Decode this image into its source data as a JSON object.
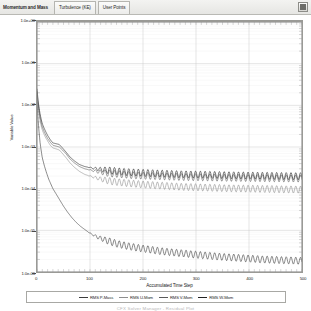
{
  "window": {
    "close_button": "close-box"
  },
  "tabs": [
    {
      "label": "Momentum and Mass",
      "active": true
    },
    {
      "label": "Turbulence (KE)",
      "active": false
    },
    {
      "label": "User Points",
      "active": false
    }
  ],
  "caption": "CFX Solver Manager - Residual Plot",
  "chart_data": {
    "type": "line",
    "title": "",
    "xlabel": "Accumulated Time Step",
    "ylabel": "Variable Value",
    "yscale": "log",
    "xlim": [
      0,
      500
    ],
    "ylim": [
      1e-06,
      1
    ],
    "grid": true,
    "legend_position": "bottom",
    "xticks": [
      0,
      100,
      200,
      300,
      400,
      500
    ],
    "xtick_labels": [
      "0",
      "100",
      "200",
      "300",
      "400",
      "500"
    ],
    "yticks": [
      1,
      0.1,
      0.01,
      0.001,
      0.0001,
      1e-05,
      1e-06
    ],
    "ytick_labels": [
      "1.0e+00",
      "1.0e-01",
      "1.0e-02",
      "1.0e-03",
      "1.0e-04",
      "1.0e-05",
      "1.0e-06"
    ],
    "series": [
      {
        "name": "RMS P-Mass",
        "color": "#3c3c3c",
        "x": [
          0,
          2,
          4,
          6,
          8,
          10,
          14,
          18,
          22,
          26,
          30,
          36,
          42,
          50,
          58,
          66,
          74,
          82,
          90,
          100,
          115,
          130,
          150,
          170,
          190,
          210,
          230,
          250,
          275,
          300,
          325,
          350,
          375,
          400,
          425,
          450,
          475,
          500
        ],
        "y": [
          0.012,
          0.0045,
          0.0022,
          0.0012,
          0.0008,
          0.00055,
          0.00035,
          0.00024,
          0.00017,
          0.00013,
          0.0001,
          7.5e-05,
          5.6e-05,
          3.8e-05,
          2.7e-05,
          2e-05,
          1.55e-05,
          1.25e-05,
          1.05e-05,
          8.5e-06,
          6.8e-06,
          5.8e-06,
          4.8e-06,
          4.2e-06,
          3.8e-06,
          3.5e-06,
          3.2e-06,
          3e-06,
          2.8e-06,
          2.6e-06,
          2.45e-06,
          2.3e-06,
          2.2e-06,
          2.1e-06,
          2e-06,
          1.95e-06,
          1.9e-06,
          1.85e-06
        ]
      },
      {
        "name": "RMS U-Mom",
        "color": "#8e8e8e",
        "x": [
          0,
          2,
          4,
          6,
          9,
          12,
          16,
          20,
          25,
          30,
          36,
          42,
          48,
          55,
          62,
          70,
          80,
          90,
          100,
          120,
          140,
          160,
          180,
          200,
          225,
          250,
          275,
          300,
          330,
          360,
          400,
          440,
          470,
          500
        ],
        "y": [
          0.02,
          0.009,
          0.006,
          0.0042,
          0.0028,
          0.0022,
          0.0017,
          0.0014,
          0.0011,
          0.00095,
          0.0009,
          0.00085,
          0.0007,
          0.00055,
          0.00042,
          0.00033,
          0.00026,
          0.00022,
          0.0002,
          0.00017,
          0.00015,
          0.00014,
          0.000132,
          0.000126,
          0.00012,
          0.000115,
          0.00011,
          0.000108,
          0.000105,
          0.000102,
          0.0001,
          9.8e-05,
          9.6e-05,
          9.5e-05
        ]
      },
      {
        "name": "RMS V-Mom",
        "color": "#5a5a5a",
        "x": [
          0,
          2,
          4,
          6,
          9,
          12,
          16,
          20,
          25,
          30,
          36,
          42,
          48,
          55,
          62,
          70,
          80,
          90,
          100,
          120,
          140,
          160,
          180,
          200,
          225,
          250,
          275,
          300,
          330,
          360,
          400,
          440,
          470,
          500
        ],
        "y": [
          0.022,
          0.011,
          0.007,
          0.005,
          0.0033,
          0.0026,
          0.002,
          0.0016,
          0.0013,
          0.0011,
          0.00105,
          0.001,
          0.00085,
          0.00068,
          0.00052,
          0.00042,
          0.00034,
          0.0003,
          0.00028,
          0.00025,
          0.00023,
          0.00022,
          0.00021,
          0.000205,
          0.0002,
          0.000195,
          0.00019,
          0.000188,
          0.000185,
          0.000182,
          0.00018,
          0.000178,
          0.000176,
          0.000175
        ]
      },
      {
        "name": "RMS W-Mom",
        "color": "#222222",
        "x": [
          0,
          2,
          4,
          6,
          9,
          12,
          16,
          20,
          25,
          30,
          36,
          42,
          48,
          55,
          62,
          70,
          80,
          90,
          100,
          120,
          140,
          160,
          180,
          200,
          225,
          250,
          275,
          300,
          330,
          360,
          400,
          440,
          470,
          500
        ],
        "y": [
          0.025,
          0.013,
          0.0085,
          0.006,
          0.004,
          0.0031,
          0.0024,
          0.0019,
          0.0015,
          0.00125,
          0.0012,
          0.00115,
          0.00095,
          0.00075,
          0.00058,
          0.00047,
          0.00038,
          0.00034,
          0.00032,
          0.00029,
          0.00027,
          0.000255,
          0.000245,
          0.00024,
          0.000232,
          0.000226,
          0.00022,
          0.000218,
          0.000214,
          0.00021,
          0.000206,
          0.000203,
          0.0002,
          0.000199
        ]
      }
    ],
    "oscillation": {
      "enabled": true,
      "start_x": 95,
      "period": 9,
      "amplitude_log": 0.085
    }
  }
}
